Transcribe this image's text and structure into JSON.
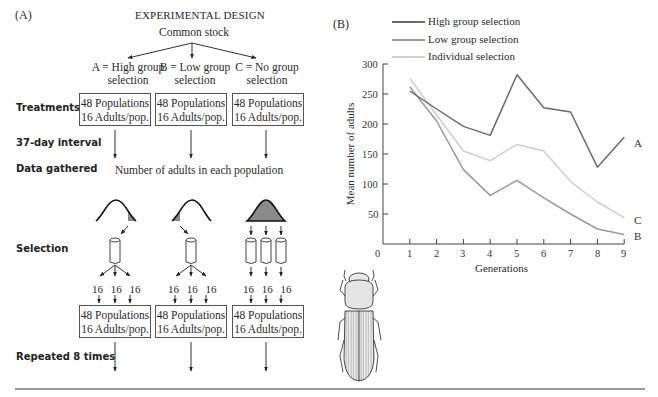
{
  "panel_a": {
    "label": "(A)",
    "title": "EXPERIMENTAL DESIGN",
    "root": "Common stock",
    "treatments": [
      {
        "line1": "A = High group",
        "line2": "selection"
      },
      {
        "line1": "B = Low group",
        "line2": "selection"
      },
      {
        "line1": "C = No group",
        "line2": "selection"
      }
    ],
    "row_labels": {
      "treatments": "Treatments",
      "interval": "37-day interval",
      "data": "Data gathered",
      "selection": "Selection",
      "repeated": "Repeated 8 times"
    },
    "box": {
      "line1": "48 Populations",
      "line2": "16 Adults/pop."
    },
    "data_gathered_text": "Number of adults in each population",
    "split_count": "16",
    "shade_color": "#8a8a8a"
  },
  "panel_b": {
    "label": "(B)",
    "end_labels": {
      "high": "A",
      "low": "B",
      "individual": "C"
    }
  },
  "chart_data": {
    "type": "line",
    "title": "",
    "xlabel": "Generations",
    "ylabel": "Mean number of adults",
    "x": [
      1,
      2,
      3,
      4,
      5,
      6,
      7,
      8,
      9
    ],
    "xticks": [
      "0",
      "1",
      "2",
      "3",
      "4",
      "5",
      "6",
      "7",
      "8",
      "9"
    ],
    "yticks": [
      "50",
      "100",
      "150",
      "200",
      "250",
      "300"
    ],
    "xlim": [
      0,
      9
    ],
    "ylim": [
      0,
      300
    ],
    "grid": false,
    "legend_position": "top",
    "series": [
      {
        "name": "High group selection",
        "end_label": "A",
        "color": "#6b6b6b",
        "values": [
          255,
          225,
          196,
          181,
          282,
          227,
          220,
          128,
          178
        ]
      },
      {
        "name": "Low group selection",
        "end_label": "B",
        "color": "#9a9a9a",
        "values": [
          262,
          205,
          124,
          81,
          106,
          77,
          50,
          25,
          16
        ]
      },
      {
        "name": "Individual selection",
        "end_label": "C",
        "color": "#cfcfcf",
        "values": [
          276,
          215,
          155,
          139,
          166,
          155,
          104,
          70,
          44
        ]
      }
    ]
  }
}
